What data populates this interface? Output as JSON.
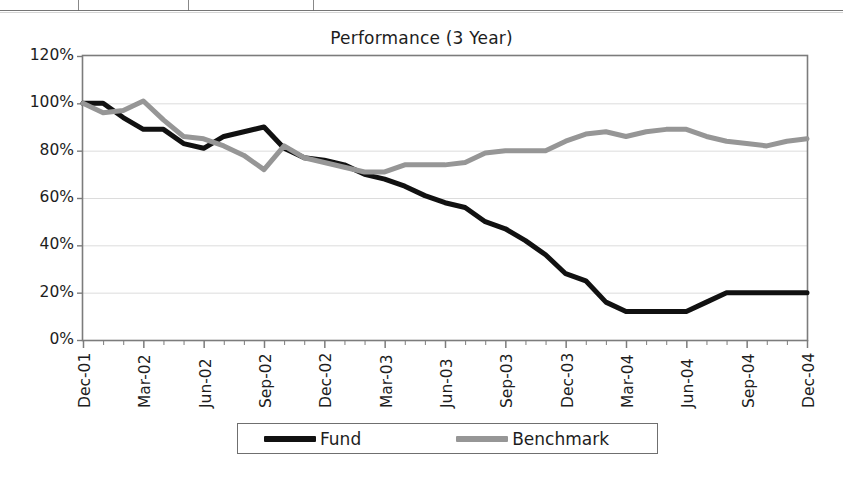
{
  "chart_data": {
    "type": "line",
    "title": "Performance (3 Year)",
    "xlabel": "",
    "ylabel": "",
    "ylim": [
      0,
      120
    ],
    "ytick_labels": [
      "0%",
      "20%",
      "40%",
      "60%",
      "80%",
      "100%",
      "120%"
    ],
    "ytick_values": [
      0,
      20,
      40,
      60,
      80,
      100,
      120
    ],
    "grid": true,
    "legend_position": "bottom",
    "x": [
      "Dec-01",
      "Jan-02",
      "Feb-02",
      "Mar-02",
      "Apr-02",
      "May-02",
      "Jun-02",
      "Jul-02",
      "Aug-02",
      "Sep-02",
      "Oct-02",
      "Nov-02",
      "Dec-02",
      "Jan-03",
      "Feb-03",
      "Mar-03",
      "Apr-03",
      "May-03",
      "Jun-03",
      "Jul-03",
      "Aug-03",
      "Sep-03",
      "Oct-03",
      "Nov-03",
      "Dec-03",
      "Jan-04",
      "Feb-04",
      "Mar-04",
      "Apr-04",
      "May-04",
      "Jun-04",
      "Jul-04",
      "Aug-04",
      "Sep-04",
      "Oct-04",
      "Nov-04",
      "Dec-04"
    ],
    "xtick_labels": [
      "Dec-01",
      "Mar-02",
      "Jun-02",
      "Sep-02",
      "Dec-02",
      "Mar-03",
      "Jun-03",
      "Sep-03",
      "Dec-03",
      "Mar-04",
      "Jun-04",
      "Sep-04",
      "Dec-04"
    ],
    "xtick_indices": [
      0,
      3,
      6,
      9,
      12,
      15,
      18,
      21,
      24,
      27,
      30,
      33,
      36
    ],
    "series": [
      {
        "name": "Fund",
        "color": "#111111",
        "values": [
          100,
          100,
          94,
          89,
          89,
          83,
          81,
          86,
          88,
          90,
          81,
          77,
          76,
          74,
          70,
          68,
          65,
          61,
          58,
          56,
          50,
          47,
          42,
          36,
          28,
          25,
          16,
          12,
          12,
          12,
          12,
          16,
          20,
          20,
          20,
          20,
          20
        ]
      },
      {
        "name": "Benchmark",
        "color": "#969696",
        "values": [
          100,
          96,
          97,
          101,
          93,
          86,
          85,
          82,
          78,
          72,
          82,
          77,
          75,
          73,
          71,
          71,
          74,
          74,
          74,
          75,
          79,
          80,
          80,
          80,
          84,
          87,
          88,
          86,
          88,
          89,
          89,
          86,
          84,
          83,
          82,
          84,
          85
        ]
      }
    ]
  },
  "legend": {
    "entries": [
      {
        "label": "Fund",
        "color": "#111111"
      },
      {
        "label": "Benchmark",
        "color": "#969696"
      }
    ]
  }
}
